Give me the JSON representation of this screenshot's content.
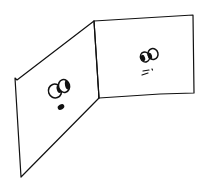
{
  "drawing": {
    "description": "Hand-drawn sketch of a folded two-panel screen, each panel with a cartoon face",
    "stroke_color": "#111111",
    "background_color": "#ffffff",
    "panels": [
      {
        "name": "left-panel",
        "face": {
          "expression": "surprised",
          "eyes": "two large round eyes with dark pupils looking right",
          "mouth": "small filled dark oval"
        }
      },
      {
        "name": "right-panel",
        "face": {
          "expression": "neutral",
          "eyes": "two round eyes with dark pupils looking left",
          "mouth": "short dashes"
        }
      }
    ]
  }
}
